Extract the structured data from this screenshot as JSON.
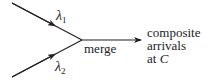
{
  "diagram": {
    "inputs": [
      {
        "label_symbol": "λ",
        "label_sub": "1"
      },
      {
        "label_symbol": "λ",
        "label_sub": "2"
      }
    ],
    "merge_label": "merge",
    "output_lines": [
      "composite",
      "arrivals",
      "at "
    ],
    "output_var": "C",
    "colors": {
      "stroke": "#222222",
      "background": "#ffffff"
    }
  }
}
